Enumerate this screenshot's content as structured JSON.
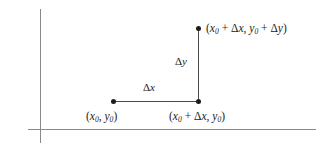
{
  "figure": {
    "background_color": "#ffffff",
    "axis_color": "#8a8a8a",
    "line_color": "#4a4a4a",
    "point_color": "#1c1c1c"
  },
  "axes": {
    "x_axis_name": "horizontal-axis",
    "y_axis_name": "vertical-axis"
  },
  "points": [
    {
      "id": "origin",
      "label": "(x0, y0)"
    },
    {
      "id": "corner",
      "label": "(x0 + Δx, y0)"
    },
    {
      "id": "top",
      "label": "(x0 + Δx, y0 + Δy)"
    }
  ],
  "labels": {
    "origin": {
      "open": "(",
      "x_var": "x",
      "x_sub": "0",
      "comma": ", ",
      "y_var": "y",
      "y_sub": "0",
      "close": ")"
    },
    "corner": {
      "open": "(",
      "x_var": "x",
      "x_sub": "0",
      "plus": " + ",
      "delta_x": "Δ",
      "dx_var": "x",
      "comma": ", ",
      "y_var": "y",
      "y_sub": "0",
      "close": ")"
    },
    "top": {
      "open": "(",
      "x_var": "x",
      "x_sub": "0",
      "plus1": " + ",
      "delta_x": "Δ",
      "dx_var": "x",
      "comma": ", ",
      "y_var": "y",
      "y_sub": "0",
      "plus2": " + ",
      "delta_y": "Δ",
      "dy_var": "y",
      "close": ")"
    },
    "delta_x": {
      "delta": "Δ",
      "var": "x"
    },
    "delta_y": {
      "delta": "Δ",
      "var": "y"
    }
  }
}
